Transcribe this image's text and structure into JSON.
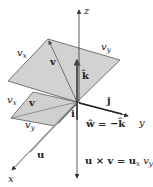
{
  "diagram": {
    "type": "3d-vector-cross-product",
    "axes": {
      "x": "x",
      "y": "y",
      "z": "z"
    },
    "unit_vectors": {
      "i": "i",
      "j": "j",
      "k": "k",
      "k_hat": "k̂"
    },
    "vectors": {
      "u": "u",
      "v_upper": "v",
      "v_lower": "v"
    },
    "component_labels": {
      "upper_vx": "v",
      "upper_vx_sub": "x",
      "upper_vy": "v",
      "upper_vy_sub": "y",
      "lower_vx": "v",
      "lower_vx_sub": "x",
      "lower_vy": "v",
      "lower_vy_sub": "y"
    },
    "equations": {
      "w_hat": "ŵ = −k̂",
      "cross": "u × v = u",
      "cross_sub_x": "x",
      "cross_vy": " v",
      "cross_sub_y": "y",
      "cross_k": " k̂"
    },
    "colors": {
      "plane_fill": "#cfcfcf",
      "plane_edge": "#555555",
      "axis": "#333333"
    }
  }
}
